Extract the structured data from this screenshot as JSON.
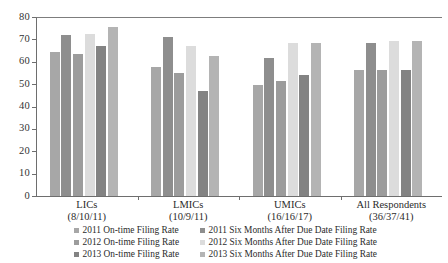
{
  "chart_data": {
    "type": "bar",
    "title": "",
    "subtitle": "",
    "xlabel": "",
    "ylabel": "",
    "ylim": [
      0,
      80
    ],
    "yticks": [
      0,
      10,
      20,
      30,
      40,
      50,
      60,
      70,
      80
    ],
    "grid": false,
    "legend_position": "bottom",
    "categories": [
      "LICs",
      "LMICs",
      "UMICs",
      "All Respondents"
    ],
    "category_sublabels": [
      "(8/10/11)",
      "(10/9/11)",
      "(16/16/17)",
      "(36/37/41)"
    ],
    "series": [
      {
        "name": "2011 On-time Filing Rate",
        "color": "#a7a7a7",
        "values": [
          64.5,
          57.5,
          49.5,
          56.5
        ]
      },
      {
        "name": "2011 Six Months After Due Date Filing Rate",
        "color": "#8e8e8e",
        "values": [
          72.0,
          71.0,
          61.5,
          68.5
        ]
      },
      {
        "name": "2012 On-time Filing Rate",
        "color": "#9c9c9c",
        "values": [
          63.5,
          55.0,
          51.5,
          56.5
        ]
      },
      {
        "name": "2012 Six Months After Due Date Filing Rate",
        "color": "#dcdcdc",
        "values": [
          72.5,
          67.0,
          68.5,
          69.5
        ]
      },
      {
        "name": "2013 On-time Filing Rate",
        "color": "#838383",
        "values": [
          67.0,
          47.0,
          54.0,
          56.5
        ]
      },
      {
        "name": "2013 Six Months After Due Date Filing Rate",
        "color": "#b4b4b4",
        "values": [
          75.5,
          62.5,
          68.5,
          69.5
        ]
      }
    ]
  },
  "legend": {
    "left_column": [
      "2011 On-time Filing Rate",
      "2012 On-time Filing Rate",
      "2013 On-time Filing Rate"
    ],
    "right_column": [
      "2011 Six Months After Due Date Filing Rate",
      "2012 Six Months After Due Date Filing Rate",
      "2013 Six Months After Due Date Filing Rate"
    ]
  }
}
